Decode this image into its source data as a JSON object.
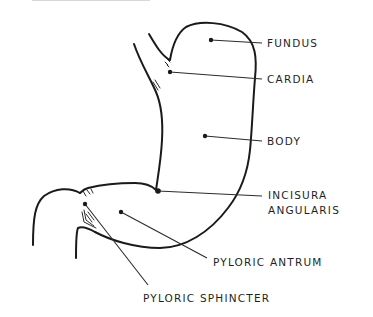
{
  "diagram": {
    "type": "anatomical-line-drawing",
    "colors": {
      "line": "#1a1a1a",
      "background": "#ffffff",
      "text": "#1f1f1f"
    },
    "labels": [
      {
        "id": "fundus",
        "text": "FUNDUS"
      },
      {
        "id": "cardia",
        "text": "CARDIA"
      },
      {
        "id": "body",
        "text": "BODY"
      },
      {
        "id": "incisura",
        "text": "INCISURA",
        "text2": "ANGULARIS"
      },
      {
        "id": "antrum",
        "text": "PYLORIC ANTRUM"
      },
      {
        "id": "sphincter",
        "text": "PYLORIC SPHINCTER"
      }
    ]
  }
}
